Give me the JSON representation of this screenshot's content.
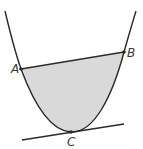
{
  "diagram": {
    "type": "parabola-with-chord-and-tangent",
    "colors": {
      "curve": "#2a2a2a",
      "fill": "#d9d9d9",
      "background": "#ffffff"
    },
    "points": {
      "A": {
        "label": "A",
        "x": 21,
        "y": 69
      },
      "B": {
        "label": "B",
        "x": 124,
        "y": 52
      },
      "C": {
        "label": "C",
        "x": 71,
        "y": 132
      }
    },
    "elements": [
      {
        "name": "parabola",
        "description": "Upward-opening parabola"
      },
      {
        "name": "chord-AB",
        "description": "Line segment from A to B"
      },
      {
        "name": "tangent-at-C",
        "description": "Tangent line touching parabola at C"
      },
      {
        "name": "shaded-region",
        "description": "Region bounded by chord AB and parabola"
      }
    ]
  }
}
